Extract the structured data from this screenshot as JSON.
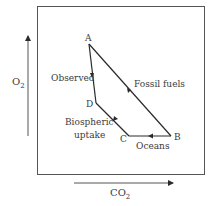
{
  "diagram": {
    "type": "vector-diagram",
    "axes": {
      "x_label": "CO",
      "x_label_sub": "2",
      "y_label": "O",
      "y_label_sub": "2"
    },
    "points": {
      "A": "A",
      "B": "B",
      "C": "C",
      "D": "D"
    },
    "segments": {
      "fossil_fuels": "Fossil fuels",
      "oceans": "Oceans",
      "biospheric_line1": "Biospheric",
      "biospheric_line2": "uptake",
      "observed": "Observed"
    },
    "colors": {
      "line": "#2a2a2a",
      "frame": "#555555",
      "text": "#3a3a3a"
    }
  }
}
